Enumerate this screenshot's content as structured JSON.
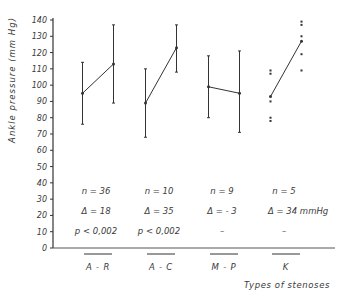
{
  "chart_data": {
    "type": "line",
    "title": "",
    "ylabel": "Ankle pressure (mm Hg)",
    "xlabel": "Types of stenoses",
    "ylim": [
      0,
      140
    ],
    "yticks": [
      0,
      10,
      20,
      30,
      40,
      50,
      60,
      70,
      80,
      90,
      100,
      110,
      120,
      130,
      140
    ],
    "grid": false,
    "legend": null,
    "categories": [
      "A - R",
      "A - C",
      "M - P",
      "K"
    ],
    "groups": [
      {
        "label": "A - R",
        "before": {
          "mean": 95,
          "upper": 114,
          "lower": 76
        },
        "after": {
          "mean": 113,
          "upper": 137,
          "lower": 89
        },
        "stats": {
          "n": "n = 36",
          "delta": "Δ = 18",
          "p": "p < 0,002"
        }
      },
      {
        "label": "A - C",
        "before": {
          "mean": 89,
          "upper": 110,
          "lower": 68
        },
        "after": {
          "mean": 123,
          "upper": 137,
          "lower": 108
        },
        "stats": {
          "n": "n = 10",
          "delta": "Δ = 35",
          "p": "p < 0,002"
        }
      },
      {
        "label": "M - P",
        "before": {
          "mean": 99,
          "upper": 118,
          "lower": 80
        },
        "after": {
          "mean": 95,
          "upper": 121,
          "lower": 71
        },
        "stats": {
          "n": "n = 9",
          "delta": "Δ = - 3",
          "p": "–"
        }
      },
      {
        "label": "K",
        "before": {
          "mean": 93,
          "points": [
            109,
            107,
            90,
            80,
            78
          ]
        },
        "after": {
          "mean": 127,
          "points": [
            139,
            137,
            130,
            119,
            109
          ]
        },
        "stats": {
          "n": "n = 5",
          "delta": "Δ = 34 mmHg",
          "p": "–"
        }
      }
    ]
  }
}
